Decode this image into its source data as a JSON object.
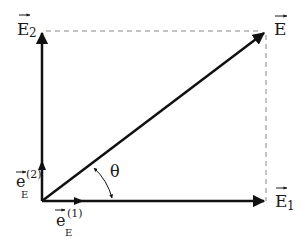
{
  "diagram": {
    "type": "vector-decomposition",
    "colors": {
      "vector": "#111111",
      "dashed": "#888888",
      "text": "#1a1a1a"
    },
    "labels": {
      "resultant": {
        "symbol": "E",
        "sub": ""
      },
      "component_x": {
        "symbol": "E",
        "sub": "1"
      },
      "component_y": {
        "symbol": "E",
        "sub": "2"
      },
      "unit_x": {
        "symbol": "e",
        "sub": "E",
        "sup": "(1)"
      },
      "unit_y": {
        "symbol": "e",
        "sub": "E",
        "sup": "(2)"
      },
      "angle": "θ"
    }
  }
}
